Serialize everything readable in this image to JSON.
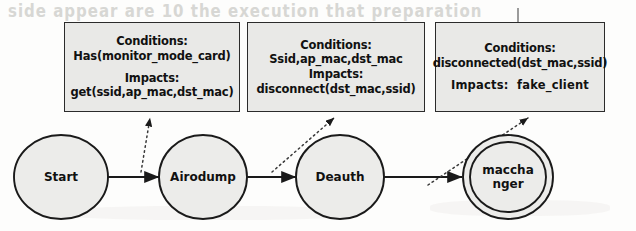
{
  "figure": {
    "type": "state-transition-diagram",
    "background_color": "#fdfdfc",
    "box_fill_color": "#e9e9e7",
    "box_border_color": "#2b2b2b",
    "node_fill_color": "#ececea",
    "node_border_color": "#1a1a1a",
    "edge_color": "#1a1a1a",
    "leader_style": "dotted",
    "text_color": "#111111"
  },
  "annotations": [
    {
      "id": "annotation-airodump",
      "conditions_label": "Conditions:",
      "conditions_value": "Has(monitor_mode_card)",
      "impacts_label": "Impacts:",
      "impacts_value": "get(ssid,ap_mac,dst_mac)"
    },
    {
      "id": "annotation-deauth",
      "conditions_label": "Conditions:",
      "conditions_value": "Ssid,ap_mac,dst_mac",
      "impacts_label": "Impacts:",
      "impacts_value": "disconnect(dst_mac,ssid)"
    },
    {
      "id": "annotation-macchanger",
      "conditions_label": "Conditions:",
      "conditions_value": "disconnected(dst_mac,ssid)",
      "impacts_label": "Impacts:",
      "impacts_value": "fake_client"
    }
  ],
  "nodes": [
    {
      "id": "node-start",
      "label": "Start",
      "final": false
    },
    {
      "id": "node-airodump",
      "label": "Airodump",
      "final": false
    },
    {
      "id": "node-deauth",
      "label": "Deauth",
      "final": false
    },
    {
      "id": "node-macchanger",
      "label": "maccha\nnger",
      "final": true
    }
  ],
  "edges": [
    {
      "id": "edge-start-airodump",
      "from": "Start",
      "to": "Airodump",
      "style": "solid",
      "arrow": true
    },
    {
      "id": "edge-airodump-deauth",
      "from": "Airodump",
      "to": "Deauth",
      "style": "solid",
      "arrow": true
    },
    {
      "id": "edge-deauth-macchanger",
      "from": "Deauth",
      "to": "macchanger",
      "style": "solid",
      "arrow": true
    }
  ],
  "leaders": [
    {
      "id": "leader-airodump",
      "from_edge": "edge-start-airodump",
      "to_annotation": "annotation-airodump",
      "style": "dotted",
      "arrow": true
    },
    {
      "id": "leader-deauth",
      "from_edge": "edge-airodump-deauth",
      "to_annotation": "annotation-deauth",
      "style": "dotted",
      "arrow": true
    },
    {
      "id": "leader-macchanger",
      "from_edge": "edge-deauth-macchanger",
      "to_annotation": "annotation-macchanger",
      "style": "dotted",
      "arrow": true
    }
  ],
  "artifacts": {
    "top_bleed_text": "side appear are  10  the execution  that  preparation",
    "mid_bleed_text": ""
  }
}
